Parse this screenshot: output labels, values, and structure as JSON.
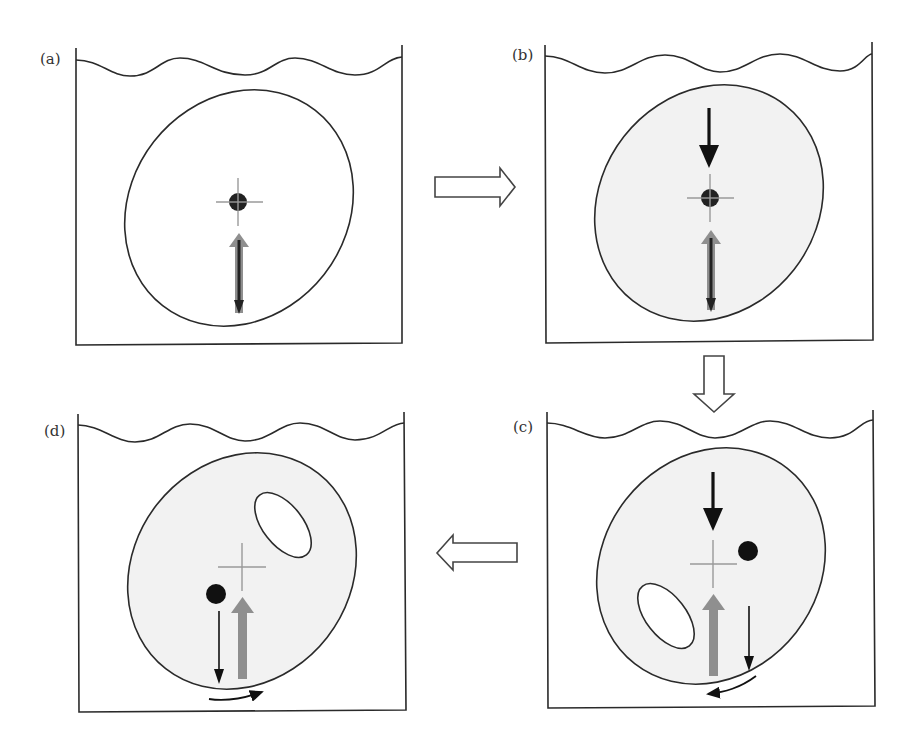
{
  "figure": {
    "type": "buoyancy / metacentric stability sequence of a floating tilted body",
    "colors": {
      "outline": "#2a2a2a",
      "body_fill_default": "#ffffff",
      "body_fill_shaded": "#f2f2f2",
      "gravity_arrow": "#111111",
      "buoyancy_arrow": "#8f8f8f",
      "center_cross": "#9a9a9a",
      "mass_dot": "#111111",
      "transition_arrow_fill": "#ffffff"
    },
    "panels": [
      {
        "id": "a",
        "label": "(a)",
        "body_shaded": false,
        "has_cavity": false,
        "elements": [
          "water-surface",
          "tank",
          "ellipse-body",
          "center-cross",
          "mass-dot-at-center",
          "buoyancy-arrow-up",
          "gravity-arrow-down"
        ]
      },
      {
        "id": "b",
        "label": "(b)",
        "body_shaded": true,
        "has_cavity": false,
        "elements": [
          "water-surface",
          "tank",
          "ellipse-body",
          "center-cross",
          "mass-dot-at-center",
          "gravity-arrow-down-above",
          "buoyancy-arrow-up",
          "gravity-arrow-down-below"
        ]
      },
      {
        "id": "c",
        "label": "(c)",
        "body_shaded": true,
        "has_cavity": true,
        "cavity_position": "lower-left",
        "elements": [
          "water-surface",
          "tank",
          "ellipse-body",
          "cavity",
          "center-cross",
          "mass-dot-upper-right",
          "gravity-arrow-down-above",
          "buoyancy-arrow-up",
          "thin-gravity-arrow",
          "rotation-arrow-counterclockwise"
        ]
      },
      {
        "id": "d",
        "label": "(d)",
        "body_shaded": true,
        "has_cavity": true,
        "cavity_position": "upper-right",
        "elements": [
          "water-surface",
          "tank",
          "ellipse-body",
          "cavity",
          "center-cross",
          "mass-dot-lower-left",
          "thin-gravity-arrow",
          "buoyancy-arrow-up",
          "rotation-arrow-clockwise"
        ]
      }
    ],
    "transitions": [
      {
        "from": "a",
        "to": "b",
        "direction": "right"
      },
      {
        "from": "b",
        "to": "c",
        "direction": "down"
      },
      {
        "from": "c",
        "to": "d",
        "direction": "left"
      }
    ]
  }
}
